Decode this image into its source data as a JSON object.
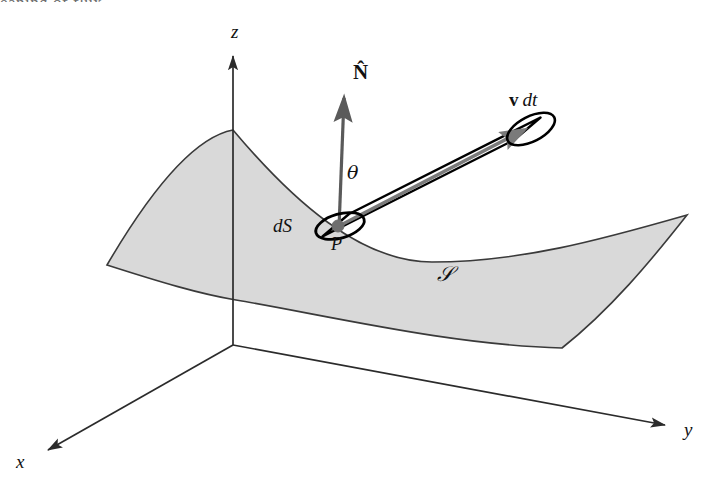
{
  "figure": {
    "type": "vector-calculus-flux-diagram",
    "caption_bleed": "eaning of flux",
    "background_color": "#ffffff",
    "surface": {
      "name": "S",
      "label": "𝒮",
      "fill_color": "#d9d9d9",
      "stroke_color": "#333333",
      "description": "curved saddle-shaped surface patch"
    },
    "axes": {
      "origin": {
        "x": 233,
        "y": 345
      },
      "items": [
        {
          "name": "z-axis",
          "label": "z",
          "tip": {
            "x": 233,
            "y": 50
          }
        },
        {
          "name": "y-axis",
          "label": "y",
          "tip": {
            "x": 671,
            "y": 427
          }
        },
        {
          "name": "x-axis",
          "label": "x",
          "tip": {
            "x": 42,
            "y": 452
          }
        }
      ],
      "stroke_color": "#2b2b2b"
    },
    "normal_vector": {
      "label": "N",
      "accent": "̂",
      "display": "N̂",
      "base": {
        "x": 339,
        "y": 226
      },
      "tip": {
        "x": 344,
        "y": 92
      },
      "color": "#595959"
    },
    "angle": {
      "label": "θ",
      "between": "normal-and-velocity"
    },
    "area_element": {
      "label": "dS",
      "point_label": "P",
      "center": {
        "x": 340,
        "y": 226
      },
      "rx": 25,
      "ry": 12,
      "rotation_deg": -16,
      "stroke_color": "#000000",
      "dot_color": "#6e6e6e"
    },
    "velocity_tube": {
      "label_vector": "v",
      "label_time": "dt",
      "display": "v dt",
      "far_center": {
        "x": 531,
        "y": 129
      },
      "stroke_color": "#000000",
      "arrow_color": "#6e6e6e"
    }
  }
}
